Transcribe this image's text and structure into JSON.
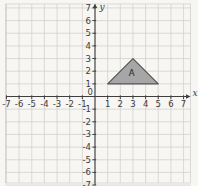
{
  "figure": {
    "type": "coordinate-plane-diagram",
    "axes": {
      "x_name": "x",
      "y_name": "y",
      "origin_label": "0",
      "x_min": -7,
      "x_max": 7,
      "y_min": -7,
      "y_max": 7,
      "tick_step": 1,
      "x_tick_labels": [
        "-7",
        "-6",
        "-5",
        "-4",
        "-3",
        "-2",
        "-1",
        "1",
        "2",
        "3",
        "4",
        "5",
        "6",
        "7"
      ],
      "y_tick_labels": [
        "-7",
        "-6",
        "-5",
        "-4",
        "-3",
        "-2",
        "-1",
        "1",
        "2",
        "3",
        "4",
        "5",
        "6",
        "7"
      ],
      "grid": true
    },
    "shapes": [
      {
        "id": "A",
        "type": "triangle",
        "label": "A",
        "vertices": [
          [
            1,
            1
          ],
          [
            5,
            1
          ],
          [
            3,
            3
          ]
        ],
        "label_position": [
          2.9,
          1.85
        ]
      }
    ],
    "colors": {
      "background": "#f7f6f2",
      "grid": "#cdcdcd",
      "axis": "#3f3f3f",
      "tick_text": "#3a3a3a",
      "shape_fill": "#a6a6a6",
      "shape_stroke": "#515151",
      "shape_label_text": "#222222"
    }
  }
}
